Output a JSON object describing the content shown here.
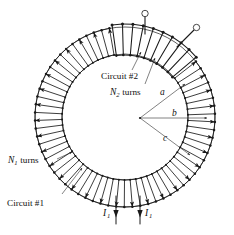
{
  "figure": {
    "background_color": "#ffffff",
    "ink_color": "#1a1a1a"
  },
  "labels": {
    "circuit2": "Circuit #2",
    "n2_turns_prefix": "N",
    "n2_turns_sub": "2",
    "n2_turns_suffix": " turns",
    "circuit1": "Circuit #1",
    "n1_turns_prefix": "N",
    "n1_turns_sub": "1",
    "n1_turns_suffix": " turns",
    "radius_a": "a",
    "radius_b": "b",
    "radius_c": "c",
    "current_left_prefix": "I",
    "current_left_sub": "1",
    "current_right_prefix": "I",
    "current_right_sub": "1"
  },
  "geometry": {
    "center_x": 125,
    "center_y": 117,
    "inner_radius_a": 63,
    "mid_radius_b": 78,
    "outer_radius_c": 90,
    "n1_turn_count": 58,
    "n2_turn_count": 9,
    "n2_arc_start_deg": -98,
    "n2_arc_end_deg": -40
  },
  "radius_vertex": {
    "x": 140,
    "y": 118
  },
  "terminals": [
    {
      "name": "terminal-left",
      "x": 145,
      "y": 13
    },
    {
      "name": "terminal-right",
      "x": 196,
      "y": 28
    }
  ],
  "current_leads": [
    {
      "name": "current-lead-left",
      "x": 116,
      "y_top": 196,
      "y_bottom": 228
    },
    {
      "name": "current-lead-right",
      "x": 140,
      "y_top": 196,
      "y_bottom": 228
    }
  ],
  "chart_data": {
    "type": "diagram",
    "annotations": [
      "Circuit #2",
      "N2 turns",
      "Circuit #1",
      "N1 turns",
      "a",
      "b",
      "c",
      "I1",
      "I1"
    ]
  }
}
